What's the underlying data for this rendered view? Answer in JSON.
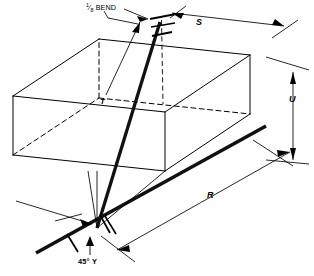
{
  "figure": {
    "type": "isometric-piping-offset-diagram",
    "background_color": "#ffffff",
    "line_color": "#000000",
    "pipe_color": "#111111"
  },
  "annotations": {
    "bend": {
      "fraction_numerator": "1",
      "fraction_denominator": "8",
      "text": "BEND",
      "full": "1/8 BEND"
    },
    "travel": {
      "label": "T"
    },
    "set": {
      "label": "S"
    },
    "rise": {
      "label": "U"
    },
    "run": {
      "label": "R"
    },
    "branch": {
      "label": "45° Y",
      "angle": "45°",
      "fitting": "Y"
    }
  },
  "dimensions": [
    {
      "name": "S",
      "label": "S",
      "orientation": "top-horizontal-isometric",
      "placement": "upper-right"
    },
    {
      "name": "U",
      "label": "U",
      "orientation": "vertical",
      "placement": "right"
    },
    {
      "name": "R",
      "label": "R",
      "orientation": "lower-diagonal-isometric",
      "placement": "bottom-right"
    },
    {
      "name": "T",
      "label": "T",
      "orientation": "leader-to-offset-pipe",
      "placement": "center-left"
    }
  ],
  "chart_data": {
    "type": "diagram",
    "title": "",
    "elements": [
      {
        "id": "reference-box",
        "kind": "wireframe-rectangular-prism",
        "visible_edges": 9,
        "hidden_edges": 3,
        "hidden_style": "dashed"
      },
      {
        "id": "offset-pipe",
        "kind": "thick-line",
        "from": "bottom-junction",
        "to": "top-bend",
        "weight": 3.2
      },
      {
        "id": "run-pipe",
        "kind": "thick-line",
        "from": "bottom-junction",
        "to": "right-end",
        "weight": 3.4
      },
      {
        "id": "bend-fitting",
        "kind": "hub-marks",
        "count": 3,
        "location": "top-vertex"
      },
      {
        "id": "y-fitting",
        "kind": "hub-marks",
        "count": 3,
        "location": "bottom-vertex"
      },
      {
        "id": "vertical-drop",
        "kind": "dashed-line",
        "from": "top-vertex",
        "to": "box-interior-vertex"
      }
    ]
  }
}
